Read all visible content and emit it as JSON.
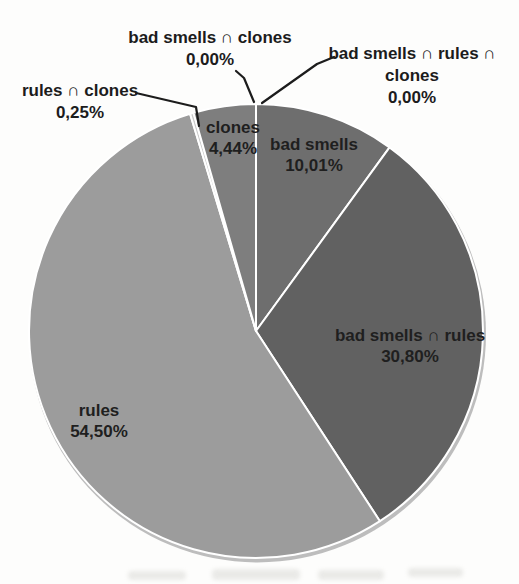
{
  "chart_data": {
    "type": "pie",
    "title": "",
    "direction": "clockwise",
    "start_angle_deg": 0,
    "decimal_separator": ",",
    "stroke_color": "#ffffff",
    "rim_shadow_color": "#bdbdbd",
    "text_color": "#1f1f1f",
    "leader_color": "#1c1c1c",
    "slices": [
      {
        "label": "bad smells",
        "value": 10.01,
        "display": "10,01%",
        "color": "#6e6e6e",
        "label_inside": true,
        "label_pos": {
          "x": 314,
          "y": 155
        }
      },
      {
        "label": "bad smells ∩ rules",
        "value": 30.8,
        "display": "30,80%",
        "color": "#616161",
        "label_inside": true,
        "label_pos": {
          "x": 410,
          "y": 346
        }
      },
      {
        "label": "rules",
        "value": 54.5,
        "display": "54,50%",
        "color": "#9c9c9c",
        "label_inside": true,
        "label_pos": {
          "x": 99,
          "y": 421
        }
      },
      {
        "label": "rules ∩ clones",
        "value": 0.25,
        "display": "0,25%",
        "color": "#cccccc",
        "label_inside": false,
        "callout_pos": {
          "x": 80,
          "y": 80
        },
        "callout_lines": [
          "rules ∩ clones"
        ],
        "leader": [
          [
            136,
            93
          ],
          [
            196,
            107
          ],
          [
            199,
            126
          ]
        ]
      },
      {
        "label": "clones",
        "value": 4.44,
        "display": "4,44%",
        "color": "#7e7e7e",
        "label_inside": true,
        "label_pos": {
          "x": 233,
          "y": 138
        }
      },
      {
        "label": "bad smells ∩ clones",
        "value": 0.0,
        "display": "0,00%",
        "color": "#6e6e6e",
        "label_inside": false,
        "callout_pos": {
          "x": 210,
          "y": 27
        },
        "callout_lines": [
          "bad smells ∩ clones"
        ],
        "leader": [
          [
            236,
            71
          ],
          [
            244,
            78
          ],
          [
            254,
            102
          ]
        ]
      },
      {
        "label": "bad smells ∩ rules ∩ clones",
        "value": 0.0,
        "display": "0,00%",
        "color": "#616161",
        "label_inside": false,
        "callout_pos": {
          "x": 412,
          "y": 43
        },
        "callout_lines": [
          "bad smells ∩ rules ∩",
          "clones"
        ],
        "leader": [
          [
            334,
            57
          ],
          [
            317,
            64
          ],
          [
            262,
            103
          ]
        ]
      }
    ]
  }
}
